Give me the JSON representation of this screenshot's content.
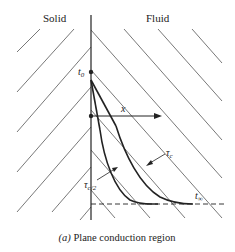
{
  "labels": {
    "solid": "Solid",
    "fluid": "Fluid",
    "t0": "t",
    "t0_sub": "0",
    "x_axis": "x",
    "tau_c": "τ",
    "tau_c_sub": "c",
    "tau_c2": "τ",
    "tau_c2_sub": "c/2",
    "t_inf": "t",
    "t_inf_sub": "∞"
  },
  "caption": {
    "prefix": "(a)",
    "text": " Plane conduction region"
  },
  "colors": {
    "line": "#222222",
    "hatch": "#555555",
    "background": "#ffffff"
  }
}
